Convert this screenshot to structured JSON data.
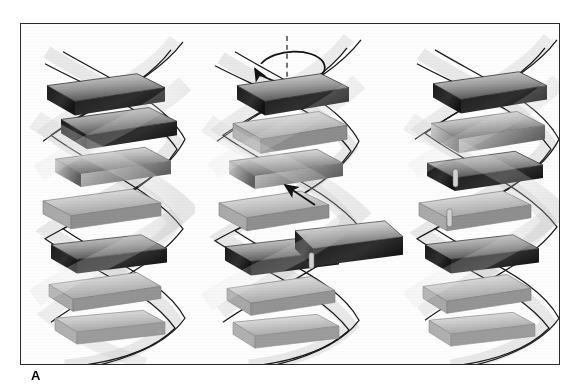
{
  "figure": {
    "caption_letter": "A",
    "panel_count": 3,
    "style": "grayscale airbrush scientific illustration",
    "background_color": "#fdfdfd",
    "frame_color": "#2b2b2b",
    "block_dark_color": "#262626",
    "block_mid_color": "#8d8d8d",
    "block_light_color": "#d8d8d8",
    "ribbon_color": "#9a9a9a",
    "strand_line_color": "#1a1a1a"
  },
  "panels": [
    {
      "id": "panel-left",
      "name": "intact-helix",
      "label": "",
      "description": "Intact B-form double helix with stacked base-pair blocks",
      "block_count": 7,
      "annotations": []
    },
    {
      "id": "panel-middle",
      "name": "extruded-base-pair",
      "label": "",
      "description": "One base-pair block swung out of the helical stack",
      "block_count": 7,
      "annotations": [
        {
          "type": "rotation-arrow",
          "name": "helical-axis-rotation-arrow",
          "about": "helical axis",
          "direction": "counterclockwise"
        },
        {
          "type": "axis-line",
          "name": "helical-axis-dashed-line",
          "style": "dashed"
        },
        {
          "type": "straight-arrow",
          "name": "reinsertion-arrow",
          "direction": "up-left",
          "meaning": "base pair returns into the stack"
        }
      ]
    },
    {
      "id": "panel-right",
      "name": "restacked-helix",
      "label": "",
      "description": "Helix with the base pair restored into the stack",
      "block_count": 7,
      "annotations": []
    }
  ]
}
